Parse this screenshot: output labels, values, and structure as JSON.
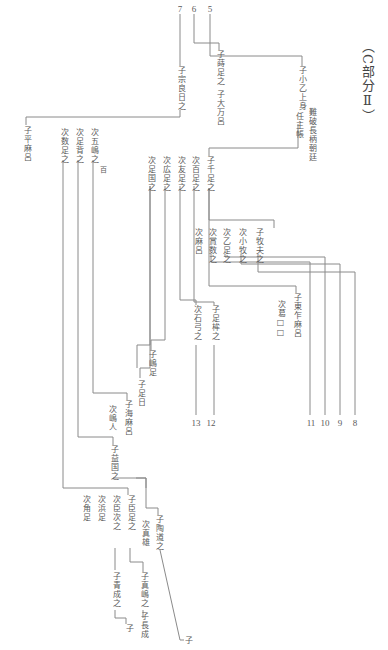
{
  "title": "（C部分Ⅱ）",
  "branch_numbers": {
    "n5": "5",
    "n6": "6",
    "n7": "7",
    "n8": "8",
    "n9": "9",
    "n10": "10",
    "n11": "11",
    "n12": "12",
    "n13": "13"
  },
  "nodes": {
    "ko_shoot_kamimi": "子小乙上身",
    "nanba_nagae_asomi": "難破長柄朝廷",
    "nin_shucho": "任主帳",
    "ko_sen_ashi_no": "子千足之",
    "ko_koe_ashi_no": "子蒔足之",
    "ko_ootomaro": "子大万呂",
    "ko_munakata": "子宗良日之",
    "ko_hiramaro": "子平麻呂",
    "ko_makifu": "子牧夫之",
    "ji_kobaku": "次小牧之",
    "ji_otoashi": "次乙足之",
    "ji_kabaku": "次賞数之",
    "ji_asamaro": "次麻呂",
    "ko_higashi": "子東乍麻呂",
    "ji_sato": "次葛□□",
    "ji_momoashi": "次百足之",
    "ji_tomoashi": "次友足之",
    "ji_hiroashi": "次広足之",
    "ji_ashikuni": "次足国之",
    "ko_ashimune": "子足桙之",
    "ji_ishiyumi": "次石弓之",
    "ko_shimaashi": "子嶋足",
    "ko_ashihi": "子足日",
    "ji_gojima": "次五嶋之",
    "hyaku": "百",
    "ji_ashise": "次足背之",
    "ji_kazuashi": "次数足之",
    "ko_amamaro": "子海麻呂",
    "ji_shimahito": "次嶋人",
    "ko_masukuni": "子益国之",
    "ko_suedomichi": "子陶道之",
    "ji_mao": "次真雄",
    "ko_omiashi": "子臣足之",
    "ji_omitsugi": "次臣次之",
    "ji_hamaashi": "次浜足",
    "ji_tsunoashi": "次角足",
    "ko_mashima": "子真嶋之",
    "ko_nagashige": "子長成",
    "ko_seisei": "子青成之",
    "ko_end1": "子",
    "ko_end2": "子"
  }
}
